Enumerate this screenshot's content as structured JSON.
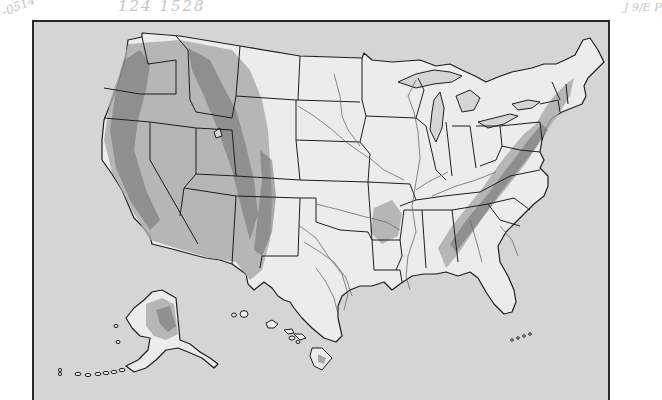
{
  "document": {
    "type": "scanned relief outline map",
    "subject": "United States (contiguous states, Alaska, Hawaii)",
    "colors": {
      "page_background": "#ffffff",
      "frame_background": "#d5d5d5",
      "land_fill": "#ececec",
      "outline": "#1e1e1e",
      "relief_shading": "#8a8a8a",
      "river": "#6a6a6a",
      "handwriting": "#c4c4c4"
    }
  },
  "annotations": {
    "left_corner": "-0514",
    "top": "124  1528",
    "right_margin": "J 9/E P"
  },
  "map": {
    "regions": [
      {
        "name": "contiguous-united-states",
        "relief": [
          "Cascades",
          "Sierra Nevada",
          "Rocky Mountains",
          "Great Basin",
          "Ozarks",
          "Appalachians",
          "Adirondacks / New England highlands"
        ]
      },
      {
        "name": "alaska"
      },
      {
        "name": "hawaii"
      }
    ],
    "labels": []
  }
}
